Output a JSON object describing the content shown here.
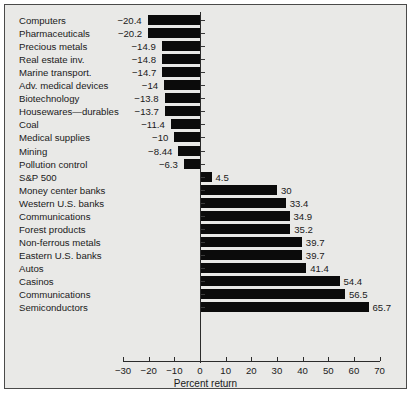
{
  "chart_data": {
    "type": "bar",
    "orientation": "horizontal",
    "title": "",
    "xlabel": "Percent return",
    "ylabel": "",
    "xlim": [
      -30,
      70
    ],
    "xticks": [
      -30,
      -20,
      -10,
      0,
      10,
      20,
      30,
      40,
      50,
      60,
      70
    ],
    "xtick_labels": [
      "−30",
      "−20",
      "−10",
      "0",
      "10",
      "20",
      "30",
      "40",
      "50",
      "60",
      "70"
    ],
    "grid": false,
    "legend": "none",
    "bar_color": "#0b0b0b",
    "background_color": "#e9e9e7",
    "categories": [
      "Computers",
      "Pharmaceuticals",
      "Precious metals",
      "Real estate inv.",
      "Marine transport.",
      "Adv. medical devices",
      "Biotechnology",
      "Housewares—durables",
      "Coal",
      "Medical supplies",
      "Mining",
      "Pollution control",
      "S&P 500",
      "Money center banks",
      "Western U.S. banks",
      "Communications",
      "Forest products",
      "Non-ferrous metals",
      "Eastern U.S. banks",
      "Autos",
      "Casinos",
      "Communications",
      "Semiconductors"
    ],
    "values": [
      -20.4,
      -20.2,
      -14.9,
      -14.8,
      -14.7,
      -14,
      -13.8,
      -13.7,
      -11.4,
      -10,
      -8.44,
      -6.3,
      4.5,
      30,
      33.4,
      34.9,
      35.2,
      39.7,
      39.7,
      41.4,
      54.4,
      56.5,
      65.7
    ],
    "value_labels": [
      "−20.4",
      "−20.2",
      "−14.9",
      "−14.8",
      "−14.7",
      "−14",
      "−13.8",
      "−13.7",
      "−11.4",
      "−10",
      "−8.44",
      "−6.3",
      "4.5",
      "30",
      "33.4",
      "34.9",
      "35.2",
      "39.7",
      "39.7",
      "41.4",
      "54.4",
      "56.5",
      "65.7"
    ]
  },
  "caption": ""
}
